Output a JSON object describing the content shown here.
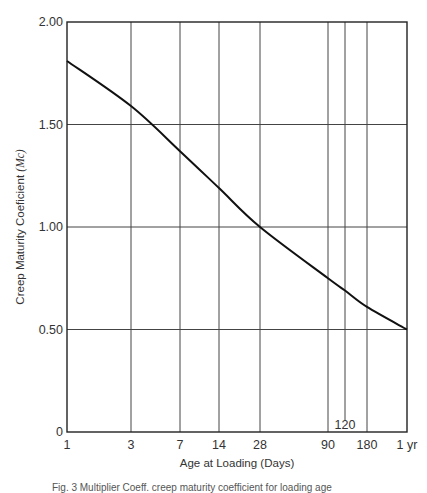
{
  "chart_data": {
    "type": "line",
    "title": "",
    "xlabel": "Age at Loading (Days)",
    "ylabel": "Creep Maturity Coeficient",
    "ylabel_symbol": "(Mc)",
    "x_scale": "log",
    "x_ticks": [
      {
        "value": 1,
        "label": "1"
      },
      {
        "value": 3,
        "label": "3"
      },
      {
        "value": 7,
        "label": "7"
      },
      {
        "value": 14,
        "label": "14"
      },
      {
        "value": 28,
        "label": "28"
      },
      {
        "value": 90,
        "label": "90"
      },
      {
        "value": 120,
        "label": "120"
      },
      {
        "value": 180,
        "label": "180"
      },
      {
        "value": 365,
        "label": "1 yr"
      }
    ],
    "y_ticks": [
      {
        "value": 0,
        "label": "0"
      },
      {
        "value": 0.5,
        "label": "0.50"
      },
      {
        "value": 1.0,
        "label": "1.00"
      },
      {
        "value": 1.5,
        "label": "1.50"
      },
      {
        "value": 2.0,
        "label": "2.00"
      }
    ],
    "ylim": [
      0,
      2.0
    ],
    "xlim": [
      1,
      365
    ],
    "grid": true,
    "legend": null,
    "series": [
      {
        "name": "Creep Maturity Coefficient",
        "x": [
          1,
          3,
          7,
          14,
          28,
          90,
          120,
          180,
          365
        ],
        "y": [
          1.81,
          1.59,
          1.37,
          1.19,
          1.0,
          0.75,
          0.69,
          0.61,
          0.5
        ]
      }
    ]
  },
  "caption": "Fig. 3 Multiplier Coeff. creep maturity coefficient for loading age"
}
